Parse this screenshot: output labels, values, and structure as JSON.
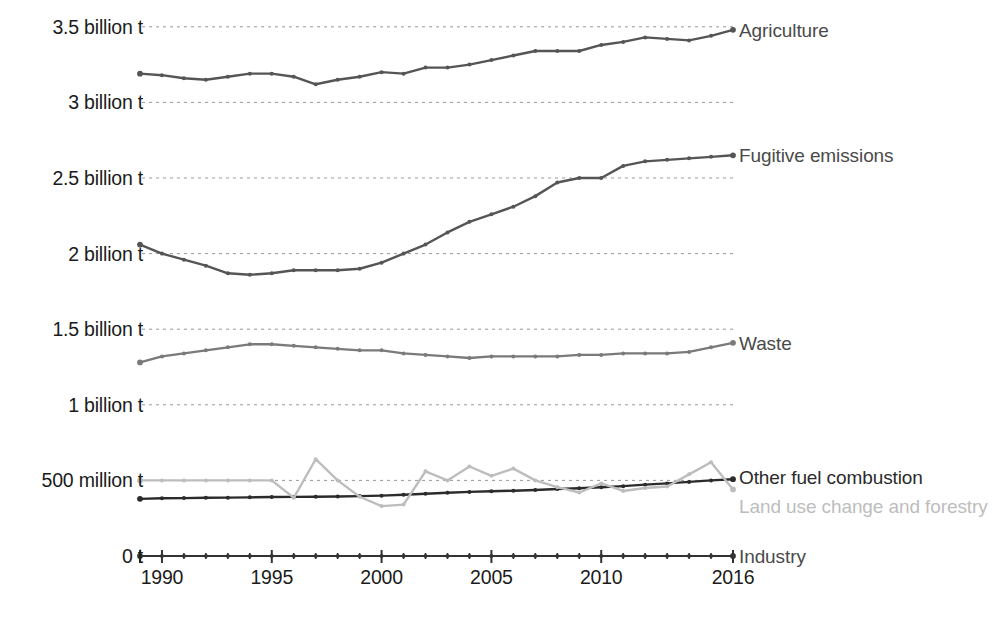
{
  "chart_data": {
    "type": "line",
    "title": "",
    "subtitle": "",
    "xlabel": "",
    "ylabel": "",
    "grid": true,
    "legend_position": "right-inline-labels",
    "x": [
      1989,
      1990,
      1991,
      1992,
      1993,
      1994,
      1995,
      1996,
      1997,
      1998,
      1999,
      2000,
      2001,
      2002,
      2003,
      2004,
      2005,
      2006,
      2007,
      2008,
      2009,
      2010,
      2011,
      2012,
      2013,
      2014,
      2015,
      2016
    ],
    "xlim": [
      1989,
      2016
    ],
    "ylim": [
      0,
      3700000000
    ],
    "y_tick_values": [
      0,
      500000000,
      1000000000,
      1500000000,
      2000000000,
      2500000000,
      3000000000,
      3500000000
    ],
    "y_tick_labels": [
      "0 t",
      "500 million t",
      "1 billion t",
      "1.5 billion t",
      "2 billion t",
      "2.5 billion t",
      "3 billion t",
      "3.5 billion t"
    ],
    "x_tick_labels": [
      "1990",
      "1995",
      "2000",
      "2005",
      "2010",
      "2016"
    ],
    "x_tick_label_values": [
      1990,
      1995,
      2000,
      2005,
      2010,
      2016
    ],
    "unit": "tonnes CO2e",
    "series": [
      {
        "name": "Agriculture",
        "label": "Agriculture",
        "color": "#555555",
        "values": [
          3.19,
          3.18,
          3.16,
          3.15,
          3.17,
          3.19,
          3.19,
          3.17,
          3.12,
          3.15,
          3.17,
          3.2,
          3.19,
          3.23,
          3.23,
          3.25,
          3.28,
          3.31,
          3.34,
          3.34,
          3.34,
          3.38,
          3.4,
          3.43,
          3.42,
          3.41,
          3.44,
          3.48
        ]
      },
      {
        "name": "Fugitive emissions",
        "label": "Fugitive emissions",
        "color": "#555555",
        "values": [
          2.06,
          2.0,
          1.96,
          1.92,
          1.87,
          1.86,
          1.87,
          1.89,
          1.89,
          1.89,
          1.9,
          1.94,
          2.0,
          2.06,
          2.14,
          2.21,
          2.26,
          2.31,
          2.38,
          2.47,
          2.5,
          2.5,
          2.58,
          2.61,
          2.62,
          2.63,
          2.64,
          2.65
        ]
      },
      {
        "name": "Waste",
        "label": "Waste",
        "color": "#7a7a7a",
        "values": [
          1.28,
          1.32,
          1.34,
          1.36,
          1.38,
          1.4,
          1.4,
          1.39,
          1.38,
          1.37,
          1.36,
          1.36,
          1.34,
          1.33,
          1.32,
          1.31,
          1.32,
          1.32,
          1.32,
          1.32,
          1.33,
          1.33,
          1.34,
          1.34,
          1.34,
          1.35,
          1.38,
          1.41
        ]
      },
      {
        "name": "Other fuel combustion",
        "label": "Other fuel combustion",
        "color": "#2b2b2b",
        "values": [
          0.378,
          0.382,
          0.383,
          0.385,
          0.386,
          0.388,
          0.39,
          0.391,
          0.392,
          0.394,
          0.396,
          0.399,
          0.405,
          0.412,
          0.418,
          0.424,
          0.428,
          0.432,
          0.437,
          0.443,
          0.448,
          0.455,
          0.462,
          0.472,
          0.48,
          0.49,
          0.5,
          0.508
        ]
      },
      {
        "name": "Land use change and forestry",
        "label": "Land use change and forestry",
        "color": "#bdbdbd",
        "values": [
          0.5,
          0.5,
          0.5,
          0.5,
          0.5,
          0.5,
          0.5,
          0.385,
          0.64,
          0.5,
          0.392,
          0.33,
          0.34,
          0.56,
          0.5,
          0.592,
          0.53,
          0.578,
          0.5,
          0.455,
          0.42,
          0.48,
          0.43,
          0.45,
          0.46,
          0.54,
          0.62,
          0.44
        ]
      },
      {
        "name": "Industry",
        "label": "Industry",
        "color": "#333333",
        "values": [
          0,
          0,
          0,
          0,
          0,
          0,
          0,
          0,
          0,
          0,
          0,
          0,
          0,
          0,
          0,
          0,
          0,
          0,
          0,
          0,
          0,
          0,
          0,
          0,
          0,
          0,
          0,
          0
        ]
      }
    ]
  },
  "layout": {
    "plot_left": 140,
    "plot_right": 733,
    "y_zero_px": 556,
    "px_per_half_billion": 75.6,
    "gridline_color": "#999999",
    "axis_color": "#333333"
  }
}
